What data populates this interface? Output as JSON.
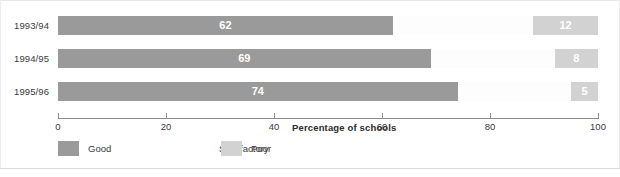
{
  "chart_data": {
    "type": "bar",
    "orientation": "horizontal",
    "stacked": true,
    "title": "",
    "xlabel": "Percentage of schools",
    "ylabel": "",
    "xlim": [
      0,
      100
    ],
    "grid": false,
    "legend_position": "bottom-left",
    "categories": [
      "1993/94",
      "1994/95",
      "1995/96"
    ],
    "tick_labels": [
      "0",
      "20",
      "40",
      "60",
      "80",
      "100"
    ],
    "tick_values": [
      0,
      20,
      40,
      60,
      80,
      100
    ],
    "series": [
      {
        "name": "Good",
        "color": "#9a9a9a",
        "values": [
          62,
          69,
          74
        ],
        "labels": [
          "62",
          "69",
          "74"
        ],
        "labels_shown": true
      },
      {
        "name": "Satisfactory",
        "color": "#fdfdfd",
        "values": [
          26,
          23,
          21
        ],
        "labels": [
          "",
          "",
          ""
        ],
        "labels_shown": false
      },
      {
        "name": "Poor",
        "color": "#d2d2d2",
        "values": [
          12,
          8,
          5
        ],
        "labels": [
          "12",
          "8",
          "5"
        ],
        "labels_shown": true
      }
    ]
  },
  "axis": {
    "title": "Percentage of schools",
    "ticks": [
      {
        "label": "0",
        "pct": 0
      },
      {
        "label": "20",
        "pct": 20
      },
      {
        "label": "40",
        "pct": 40
      },
      {
        "label": "60",
        "pct": 60
      },
      {
        "label": "80",
        "pct": 80
      },
      {
        "label": "100",
        "pct": 100
      }
    ]
  },
  "rows": [
    {
      "category": "1993/94",
      "segments": [
        {
          "series": "Good",
          "start": 0,
          "size": 62,
          "label": "62",
          "color": "#9a9a9a"
        },
        {
          "series": "Satisfactory",
          "start": 62,
          "size": 26,
          "label": "",
          "color": "#fdfdfd"
        },
        {
          "series": "Poor",
          "start": 88,
          "size": 12,
          "label": "12",
          "color": "#d2d2d2"
        }
      ]
    },
    {
      "category": "1994/95",
      "segments": [
        {
          "series": "Good",
          "start": 0,
          "size": 69,
          "label": "69",
          "color": "#9a9a9a"
        },
        {
          "series": "Satisfactory",
          "start": 69,
          "size": 23,
          "label": "",
          "color": "#fdfdfd"
        },
        {
          "series": "Poor",
          "start": 92,
          "size": 8,
          "label": "8",
          "color": "#d2d2d2"
        }
      ]
    },
    {
      "category": "1995/96",
      "segments": [
        {
          "series": "Good",
          "start": 0,
          "size": 74,
          "label": "74",
          "color": "#9a9a9a"
        },
        {
          "series": "Satisfactory",
          "start": 74,
          "size": 21,
          "label": "",
          "color": "#fdfdfd"
        },
        {
          "series": "Poor",
          "start": 95,
          "size": 5,
          "label": "5",
          "color": "#d2d2d2"
        }
      ]
    }
  ],
  "legend": [
    {
      "label": "Good",
      "color": "#9a9a9a",
      "x": 0
    },
    {
      "label": "Satisfactory",
      "color": "#ffffff",
      "x": 131
    },
    {
      "label": "Poor",
      "color": "#d2d2d2",
      "x": 163
    }
  ],
  "colors": {
    "good": "#9a9a9a",
    "satisfactory": "#fdfdfd",
    "poor": "#d2d2d2",
    "axis": "#8d8d8d",
    "text": "#3a3a3a",
    "background": "#ffffff"
  }
}
